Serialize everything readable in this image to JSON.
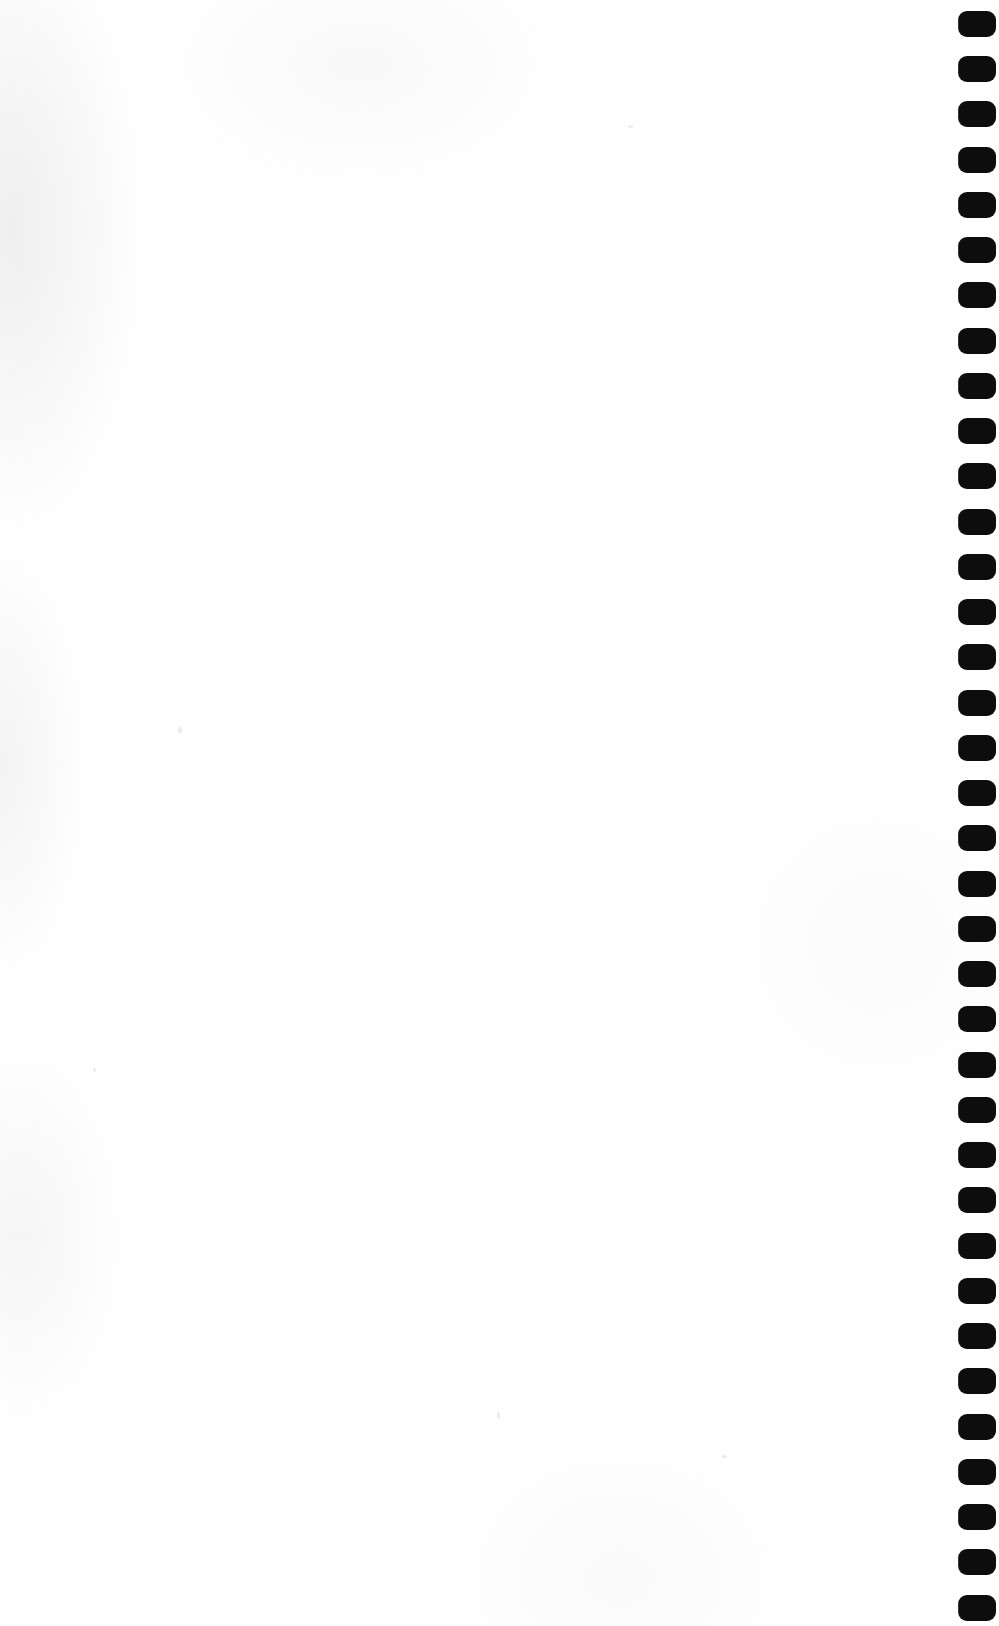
{
  "page": {
    "kind": "scanned-blank-page",
    "width": 999,
    "height": 1626,
    "background_color": "#fefefe",
    "paper_tint_color": "#f4f4f6",
    "content_text": "",
    "body_text": "",
    "visible_text": "",
    "has_visible_text": false
  },
  "content_area": {
    "label": "",
    "text": "",
    "left": 0,
    "top": 0,
    "width": 940,
    "height": 1626
  },
  "binding": {
    "name": "binding-hole-column",
    "edge": "right",
    "hole_color": "#0d0d0d",
    "hole_count": 36,
    "hole_width": 38,
    "hole_height": 26,
    "hole_corner_radius": 9,
    "pitch_y": 45.2,
    "first_hole_top": 11,
    "left": 958,
    "clipped_at_right_edge": true,
    "holes": [
      {
        "index": 1,
        "top": 11,
        "left": 958
      },
      {
        "index": 2,
        "top": 56,
        "left": 958
      },
      {
        "index": 3,
        "top": 101,
        "left": 958
      },
      {
        "index": 4,
        "top": 147,
        "left": 958
      },
      {
        "index": 5,
        "top": 192,
        "left": 958
      },
      {
        "index": 6,
        "top": 237,
        "left": 958
      },
      {
        "index": 7,
        "top": 282,
        "left": 958
      },
      {
        "index": 8,
        "top": 328,
        "left": 958
      },
      {
        "index": 9,
        "top": 373,
        "left": 958
      },
      {
        "index": 10,
        "top": 418,
        "left": 958
      },
      {
        "index": 11,
        "top": 463,
        "left": 958
      },
      {
        "index": 12,
        "top": 509,
        "left": 958
      },
      {
        "index": 13,
        "top": 554,
        "left": 958
      },
      {
        "index": 14,
        "top": 599,
        "left": 958
      },
      {
        "index": 15,
        "top": 644,
        "left": 958
      },
      {
        "index": 16,
        "top": 690,
        "left": 958
      },
      {
        "index": 17,
        "top": 735,
        "left": 958
      },
      {
        "index": 18,
        "top": 780,
        "left": 958
      },
      {
        "index": 19,
        "top": 825,
        "left": 958
      },
      {
        "index": 20,
        "top": 871,
        "left": 958
      },
      {
        "index": 21,
        "top": 916,
        "left": 958
      },
      {
        "index": 22,
        "top": 961,
        "left": 958
      },
      {
        "index": 23,
        "top": 1006,
        "left": 958
      },
      {
        "index": 24,
        "top": 1052,
        "left": 958
      },
      {
        "index": 25,
        "top": 1097,
        "left": 958
      },
      {
        "index": 26,
        "top": 1142,
        "left": 958
      },
      {
        "index": 27,
        "top": 1187,
        "left": 958
      },
      {
        "index": 28,
        "top": 1233,
        "left": 958
      },
      {
        "index": 29,
        "top": 1278,
        "left": 958
      },
      {
        "index": 30,
        "top": 1323,
        "left": 958
      },
      {
        "index": 31,
        "top": 1368,
        "left": 958
      },
      {
        "index": 32,
        "top": 1414,
        "left": 958
      },
      {
        "index": 33,
        "top": 1459,
        "left": 958
      },
      {
        "index": 34,
        "top": 1504,
        "left": 958
      },
      {
        "index": 35,
        "top": 1549,
        "left": 958
      },
      {
        "index": 36,
        "top": 1595,
        "left": 958
      }
    ]
  },
  "scan_artifacts": {
    "name": "scanner-noise",
    "edge_shadow_color": "#e4e4e6",
    "specks": 5
  }
}
